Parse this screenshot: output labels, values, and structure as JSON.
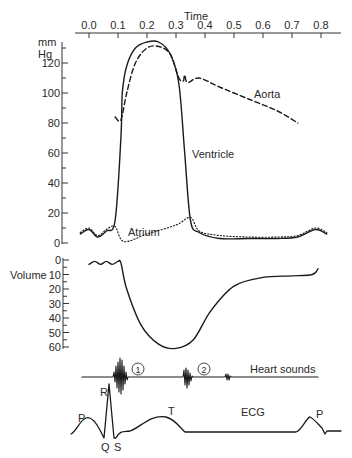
{
  "chart_data": {
    "type": "line",
    "title": "",
    "time_axis": {
      "label": "Time",
      "ticks": [
        "0.0",
        "0.1",
        "0.2",
        "0.3",
        "0.4",
        "0.5",
        "0.6",
        "0.7",
        "0.8"
      ],
      "range": [
        0.0,
        0.8
      ],
      "position": "top"
    },
    "pressure_panel": {
      "ylabel_line1": "mm",
      "ylabel_line2": "Hg",
      "ticks": [
        "0",
        "20",
        "40",
        "60",
        "80",
        "100",
        "120"
      ],
      "ylim": [
        0,
        130
      ],
      "series": [
        {
          "name": "Aorta",
          "style": "dashed",
          "x": [
            0.09,
            0.11,
            0.13,
            0.16,
            0.2,
            0.24,
            0.28,
            0.31,
            0.325,
            0.33,
            0.34,
            0.38,
            0.45,
            0.55,
            0.65,
            0.72
          ],
          "y": [
            84,
            82,
            100,
            120,
            130,
            131,
            126,
            110,
            108,
            112,
            107,
            110,
            104,
            96,
            88,
            80
          ]
        },
        {
          "name": "Ventricle",
          "style": "solid",
          "x": [
            -0.03,
            0.0,
            0.03,
            0.06,
            0.09,
            0.11,
            0.115,
            0.13,
            0.16,
            0.2,
            0.24,
            0.28,
            0.31,
            0.33,
            0.35,
            0.38,
            0.45,
            0.55,
            0.65,
            0.72,
            0.78,
            0.82
          ],
          "y": [
            6,
            9,
            4,
            8,
            15,
            70,
            100,
            118,
            130,
            134,
            134,
            126,
            106,
            60,
            15,
            7,
            3,
            3,
            3,
            4,
            9,
            6
          ]
        },
        {
          "name": "Atrium",
          "style": "dotted",
          "x": [
            -0.03,
            0.0,
            0.03,
            0.06,
            0.09,
            0.12,
            0.2,
            0.3,
            0.35,
            0.38,
            0.45,
            0.55,
            0.65,
            0.72,
            0.78,
            0.82
          ],
          "y": [
            7,
            10,
            5,
            9,
            11,
            1,
            6,
            12,
            17,
            8,
            5,
            4,
            4,
            5,
            10,
            7
          ]
        }
      ],
      "annotations": [
        "Aorta",
        "Ventricle",
        "Atrium"
      ]
    },
    "volume_panel": {
      "ylabel": "Volume",
      "ticks": [
        "0",
        "10",
        "20",
        "30",
        "40",
        "50",
        "60"
      ],
      "ylim_inverted": [
        0,
        60
      ],
      "series": [
        {
          "name": "Ventricular volume",
          "x": [
            0.0,
            0.02,
            0.04,
            0.06,
            0.08,
            0.1,
            0.11,
            0.13,
            0.18,
            0.24,
            0.3,
            0.36,
            0.42,
            0.5,
            0.6,
            0.7,
            0.77,
            0.79
          ],
          "y": [
            3,
            1,
            3,
            1,
            3,
            1,
            2,
            20,
            45,
            58,
            61,
            55,
            35,
            18,
            12,
            11,
            10,
            6
          ]
        }
      ]
    },
    "heart_sounds": {
      "label": "Heart sounds",
      "markers": [
        "①",
        "②"
      ],
      "events": [
        {
          "name": "S1",
          "time_range": [
            0.09,
            0.13
          ]
        },
        {
          "name": "S2",
          "time_range": [
            0.35,
            0.38
          ]
        },
        {
          "name": "S3",
          "time_range": [
            0.44,
            0.46
          ]
        }
      ]
    },
    "ecg": {
      "label": "ECG",
      "wave_labels": [
        "P",
        "Q",
        "R",
        "S",
        "T",
        "P"
      ]
    },
    "grid": false,
    "legend": "inline labels"
  }
}
